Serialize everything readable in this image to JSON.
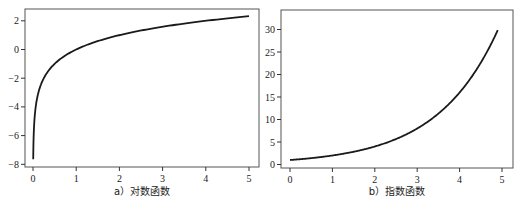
{
  "chart_data": [
    {
      "type": "line",
      "title": "",
      "caption": "a）对数函数",
      "xlabel": "",
      "ylabel": "",
      "function": "log2(x)",
      "xlim": [
        0,
        5
      ],
      "ylim": [
        -8,
        2.7
      ],
      "xticks": [
        0,
        1,
        2,
        3,
        4,
        5
      ],
      "yticks": [
        2,
        0,
        -2,
        -4,
        -6,
        -8
      ],
      "grid": false,
      "series": [
        {
          "name": "log2(x)",
          "x": [
            0.005,
            0.01,
            0.02,
            0.05,
            0.1,
            0.2,
            0.3,
            0.5,
            0.75,
            1,
            1.5,
            2,
            2.5,
            3,
            3.5,
            4,
            4.5,
            5
          ],
          "y": [
            -7.64,
            -6.64,
            -5.64,
            -4.32,
            -3.32,
            -2.32,
            -1.74,
            -1.0,
            -0.42,
            0,
            0.58,
            1.0,
            1.32,
            1.58,
            1.81,
            2.0,
            2.17,
            2.32
          ]
        }
      ],
      "frame": {
        "left": 25,
        "top": 9,
        "right": 259,
        "bottom": 167
      },
      "axis_map": {
        "x0_px": 33,
        "x_px_per_unit": 43.2,
        "y0_px": 49.5,
        "y_px_per_unit": 14.35
      }
    },
    {
      "type": "line",
      "title": "",
      "caption": "b）指数函数",
      "xlabel": "",
      "ylabel": "",
      "function": "2^x",
      "xlim": [
        0,
        5
      ],
      "ylim": [
        0,
        33
      ],
      "xticks": [
        0,
        1,
        2,
        3,
        4,
        5
      ],
      "yticks": [
        30,
        25,
        20,
        15,
        10,
        5,
        0
      ],
      "grid": false,
      "series": [
        {
          "name": "2^x",
          "x": [
            0,
            0.5,
            1,
            1.5,
            2,
            2.5,
            3,
            3.5,
            4,
            4.25,
            4.5,
            4.75,
            4.9
          ],
          "y": [
            1,
            1.41,
            2,
            2.83,
            4,
            5.66,
            8,
            11.31,
            16,
            19.03,
            22.63,
            26.91,
            29.86
          ]
        }
      ],
      "frame": {
        "left": 281,
        "top": 10,
        "right": 513,
        "bottom": 168
      },
      "axis_map": {
        "x0_px": 290,
        "x_px_per_unit": 42.4,
        "y0_px": 164.5,
        "y_px_per_unit": 4.5
      }
    }
  ]
}
